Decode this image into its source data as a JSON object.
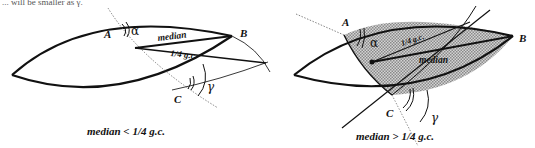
{
  "header": {
    "cropped_text": "... will be smaller as γ."
  },
  "left_figure": {
    "points": {
      "A": "A",
      "B": "B",
      "C": "C"
    },
    "angles": {
      "alpha": "α",
      "gamma": "γ"
    },
    "segment_labels": {
      "median": "median",
      "quarter_gc": "1/4 g.c."
    },
    "caption": "median < 1/4 g.c."
  },
  "right_figure": {
    "points": {
      "A": "A",
      "B": "B",
      "C": "C"
    },
    "angles": {
      "alpha": "α",
      "gamma": "γ"
    },
    "segment_labels": {
      "median": "median",
      "quarter_gc": "1/4 g.c."
    },
    "caption": "median > 1/4 g.c.",
    "shade_color": "#b8b8b8"
  },
  "colors": {
    "stroke": "#111111",
    "dotted": "#666666",
    "background": "#ffffff"
  }
}
